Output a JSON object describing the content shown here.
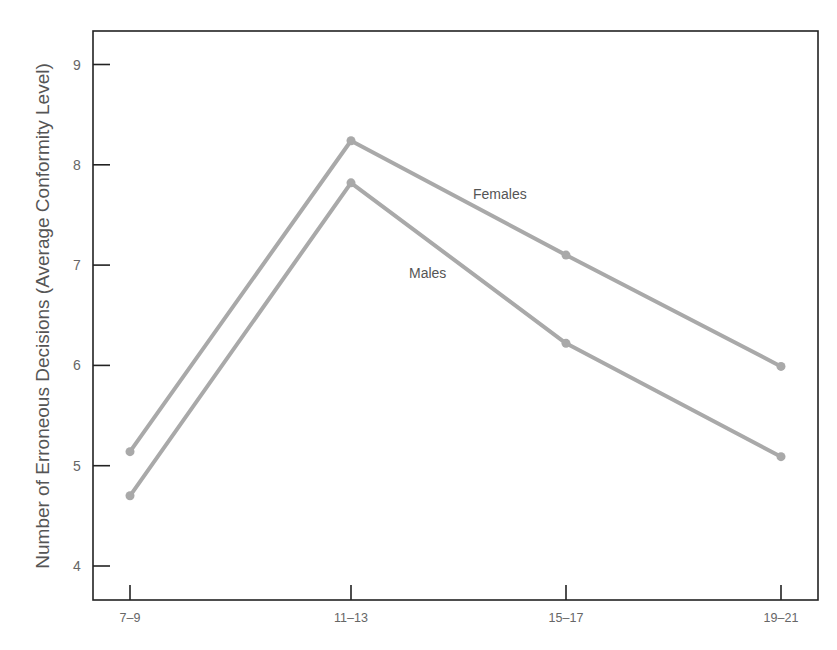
{
  "chart_data": {
    "type": "line",
    "title": "",
    "xlabel": "",
    "ylabel": "Number of Erroneous Decisions (Average Conformity Level)",
    "categories": [
      "7-9",
      "11-13",
      "15-17",
      "19-21"
    ],
    "x_tick_labels": [
      "7–9",
      "11–13",
      "15–17",
      "19–21"
    ],
    "y_ticks": [
      4,
      5,
      6,
      7,
      8,
      9
    ],
    "ylim": [
      3.66,
      9.34
    ],
    "grid": false,
    "legend": "inline labels",
    "series": [
      {
        "name": "Females",
        "values": [
          5.14,
          8.24,
          7.1,
          5.99
        ],
        "color": "#a9a9a9",
        "label_pos": {
          "x": 473,
          "y": 199
        }
      },
      {
        "name": "Males",
        "values": [
          4.7,
          7.82,
          6.22,
          5.09
        ],
        "color": "#a9a9a9",
        "label_pos": {
          "x": 409,
          "y": 278
        }
      }
    ]
  },
  "layout": {
    "plot_left": 93,
    "plot_right": 818,
    "plot_top": 31,
    "plot_bottom": 600,
    "x_positions": [
      130,
      351,
      566,
      781
    ],
    "y_zero_value": 4,
    "y_zero_px": 566,
    "px_per_unit": 100.3,
    "axis_color": "#222222"
  }
}
